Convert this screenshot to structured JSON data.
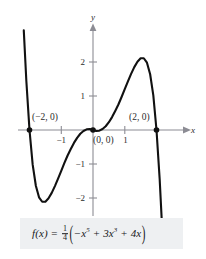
{
  "figure": {
    "axis_labels": {
      "x": "x",
      "y": "y"
    },
    "x_ticks": [
      {
        "value": -1,
        "label": "−1"
      },
      {
        "value": 1,
        "label": "1"
      }
    ],
    "y_ticks": [
      {
        "value": 2,
        "label": "2"
      },
      {
        "value": 1,
        "label": "1"
      },
      {
        "value": -1,
        "label": "−1"
      },
      {
        "value": -2,
        "label": "−2"
      }
    ],
    "points": [
      {
        "label": "(−2, 0)",
        "x": -2,
        "y": 0
      },
      {
        "label": "(0, 0)",
        "x": 0,
        "y": 0
      },
      {
        "label": "(2, 0)",
        "x": 2,
        "y": 0
      }
    ],
    "formula": {
      "fn": "f(x)",
      "equals": "=",
      "coefficient_num": "1",
      "coefficient_den": "4",
      "term1": "−x",
      "term1_exp": "5",
      "op1": "+",
      "term2": "3x",
      "term2_exp": "3",
      "op2": "+",
      "term3": "4x",
      "plain": "f(x) = 1/4(−x^5 + 3x^3 + 4x)"
    },
    "colors": {
      "curve": "#111111",
      "axis": "#8c8c94",
      "formula_background": "#eef0f2",
      "text": "#2b2b2b"
    }
  },
  "chart_data": {
    "type": "line",
    "title": "",
    "xlabel": "x",
    "ylabel": "y",
    "xlim": [
      -2.25,
      2.25
    ],
    "ylim": [
      -3.0,
      3.0
    ],
    "grid": false,
    "legend": null,
    "function": "f(x) = (1/4)(-x^5 + 3x^3 + 4x)",
    "x_tick_values": [
      -1,
      1
    ],
    "y_tick_values": [
      -2,
      -1,
      1,
      2
    ],
    "roots": [
      -2,
      0,
      2
    ],
    "annotated_points": [
      {
        "x": -2,
        "y": 0,
        "label": "(−2, 0)"
      },
      {
        "x": 0,
        "y": 0,
        "label": "(0, 0)"
      },
      {
        "x": 2,
        "y": 0,
        "label": "(2, 0)"
      }
    ],
    "local_extrema": [
      {
        "x": -1.55,
        "y": -2.1,
        "kind": "minimum"
      },
      {
        "x": 1.55,
        "y": 2.1,
        "kind": "maximum"
      }
    ],
    "series": [
      {
        "name": "f(x)",
        "x": [
          -2.18,
          -2.1,
          -2.0,
          -1.9,
          -1.8,
          -1.7,
          -1.6,
          -1.5,
          -1.4,
          -1.3,
          -1.2,
          -1.1,
          -1.0,
          -0.9,
          -0.8,
          -0.7,
          -0.6,
          -0.5,
          -0.4,
          -0.3,
          -0.2,
          -0.1,
          0.0,
          0.1,
          0.2,
          0.3,
          0.4,
          0.5,
          0.6,
          0.7,
          0.8,
          0.9,
          1.0,
          1.1,
          1.2,
          1.3,
          1.4,
          1.5,
          1.6,
          1.7,
          1.8,
          1.9,
          2.0,
          2.1,
          2.18
        ],
        "y": [
          2.93,
          1.45,
          0.0,
          -1.02,
          -1.64,
          -1.98,
          -2.11,
          -2.11,
          -2.01,
          -1.85,
          -1.65,
          -1.43,
          -1.2,
          -0.97,
          -0.75,
          -0.56,
          -0.38,
          -0.23,
          -0.11,
          -0.03,
          0.02,
          0.03,
          0.0,
          -0.03,
          -0.02,
          0.03,
          0.11,
          0.23,
          0.38,
          0.56,
          0.75,
          0.97,
          1.2,
          1.43,
          1.65,
          1.85,
          2.01,
          2.11,
          2.11,
          1.98,
          1.64,
          1.02,
          0.0,
          -1.45,
          -2.93
        ]
      }
    ]
  }
}
